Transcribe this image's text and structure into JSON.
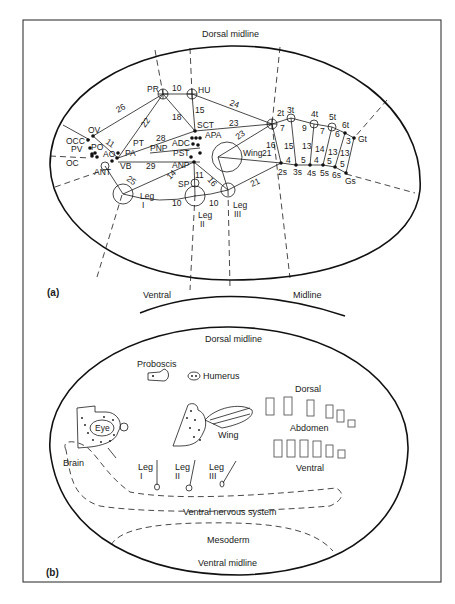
{
  "figure": {
    "panel_a": {
      "label": "(a)",
      "dorsal_midline": "Dorsal midline",
      "ventral": "Ventral",
      "midline": "Midline",
      "nodes": {
        "PR": "PR",
        "HU": "HU",
        "OV": "OV",
        "OCC": "OCC",
        "PO": "PO",
        "PV": "PV",
        "AO": "AO",
        "OC": "OC",
        "ANT": "ANT",
        "PT": "PT",
        "PA": "PA",
        "VB": "VB",
        "PNP": "PNP",
        "SCT": "SCT",
        "APA": "APA",
        "ADC": "ADC",
        "PST": "PST",
        "ANP": "ANP",
        "WING": "Wing",
        "SP": "SP",
        "LEG_I": "Leg",
        "LEG_I_NUM": "I",
        "LEG_II": "Leg",
        "LEG_II_NUM": "II",
        "LEG_III": "Leg",
        "LEG_III_NUM": "III",
        "t2": "2t",
        "t3": "3t",
        "t4": "4t",
        "t5": "5t",
        "t6": "6t",
        "Gt": "Gt",
        "s2": "2s",
        "s3": "3s",
        "s4": "4s",
        "s5": "5s",
        "s6": "6s",
        "Gs": "Gs"
      },
      "distances": {
        "PR_HU": "10",
        "PR_OV": "26",
        "PR_PT": "22",
        "PR_SCT": "18",
        "HU_SCT": "15",
        "HU_2t": "24",
        "OV_AO": "11",
        "PT_SCT": "28",
        "PA_ANP": "29",
        "ANT_LegI": "25",
        "SCT_2t": "23",
        "APA_2t": "23",
        "Wing_2s": "21",
        "ANP_LegI": "14",
        "ANP_SP": "11",
        "ANP_LegIII": "16",
        "LegI_LegII": "10",
        "LegII_LegIII": "10",
        "LegIII_2s": "21",
        "t2_s2": "16",
        "t2_t3": "7",
        "t3_s3": "15",
        "t3_t4": "9",
        "t4_s4": "13",
        "t4_t5": "7",
        "t5_s5": "14",
        "t5_t6": "6",
        "t6_s6": "13",
        "t6_Gt": "3",
        "Gt_Gs": "13",
        "s2_s3": "4",
        "s3_s4": "5",
        "s4_s5": "4",
        "s5_s6": "5",
        "s6_Gs": "5"
      }
    },
    "panel_b": {
      "label": "(b)",
      "dorsal_midline": "Dorsal midline",
      "proboscis": "Proboscis",
      "humerus": "Humerus",
      "eye": "Eye",
      "wing": "Wing",
      "brain": "Brain",
      "leg_i": "Leg",
      "leg_i_num": "I",
      "leg_ii": "Leg",
      "leg_ii_num": "II",
      "leg_iii": "Leg",
      "leg_iii_num": "III",
      "dorsal": "Dorsal",
      "abdomen": "Abdomen",
      "ventral": "Ventral",
      "ventral_nervous_system": "Ventral nervous system",
      "mesoderm": "Mesoderm",
      "ventral_midline": "Ventral midline"
    }
  }
}
